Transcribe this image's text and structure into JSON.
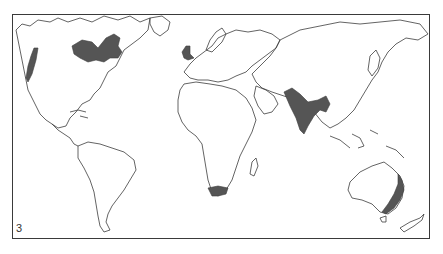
{
  "figure": {
    "panel_label": "3",
    "type": "world map outline with shaded regions"
  },
  "colors": {
    "background": "#ffffff",
    "coastline": "#3c3c3c",
    "shaded_region": "#555555",
    "frame": "#3a3a3a"
  },
  "shaded_regions": [
    {
      "id": "pacific-northwest",
      "label": "Pacific coast of North America"
    },
    {
      "id": "eastern-canada",
      "label": "Eastern Canada / Great Lakes"
    },
    {
      "id": "british-isles",
      "label": "British Isles"
    },
    {
      "id": "indian-subcontinent",
      "label": "Indian subcontinent"
    },
    {
      "id": "south-africa",
      "label": "Southern tip of Africa"
    },
    {
      "id": "eastern-australia",
      "label": "Eastern Australia"
    }
  ]
}
